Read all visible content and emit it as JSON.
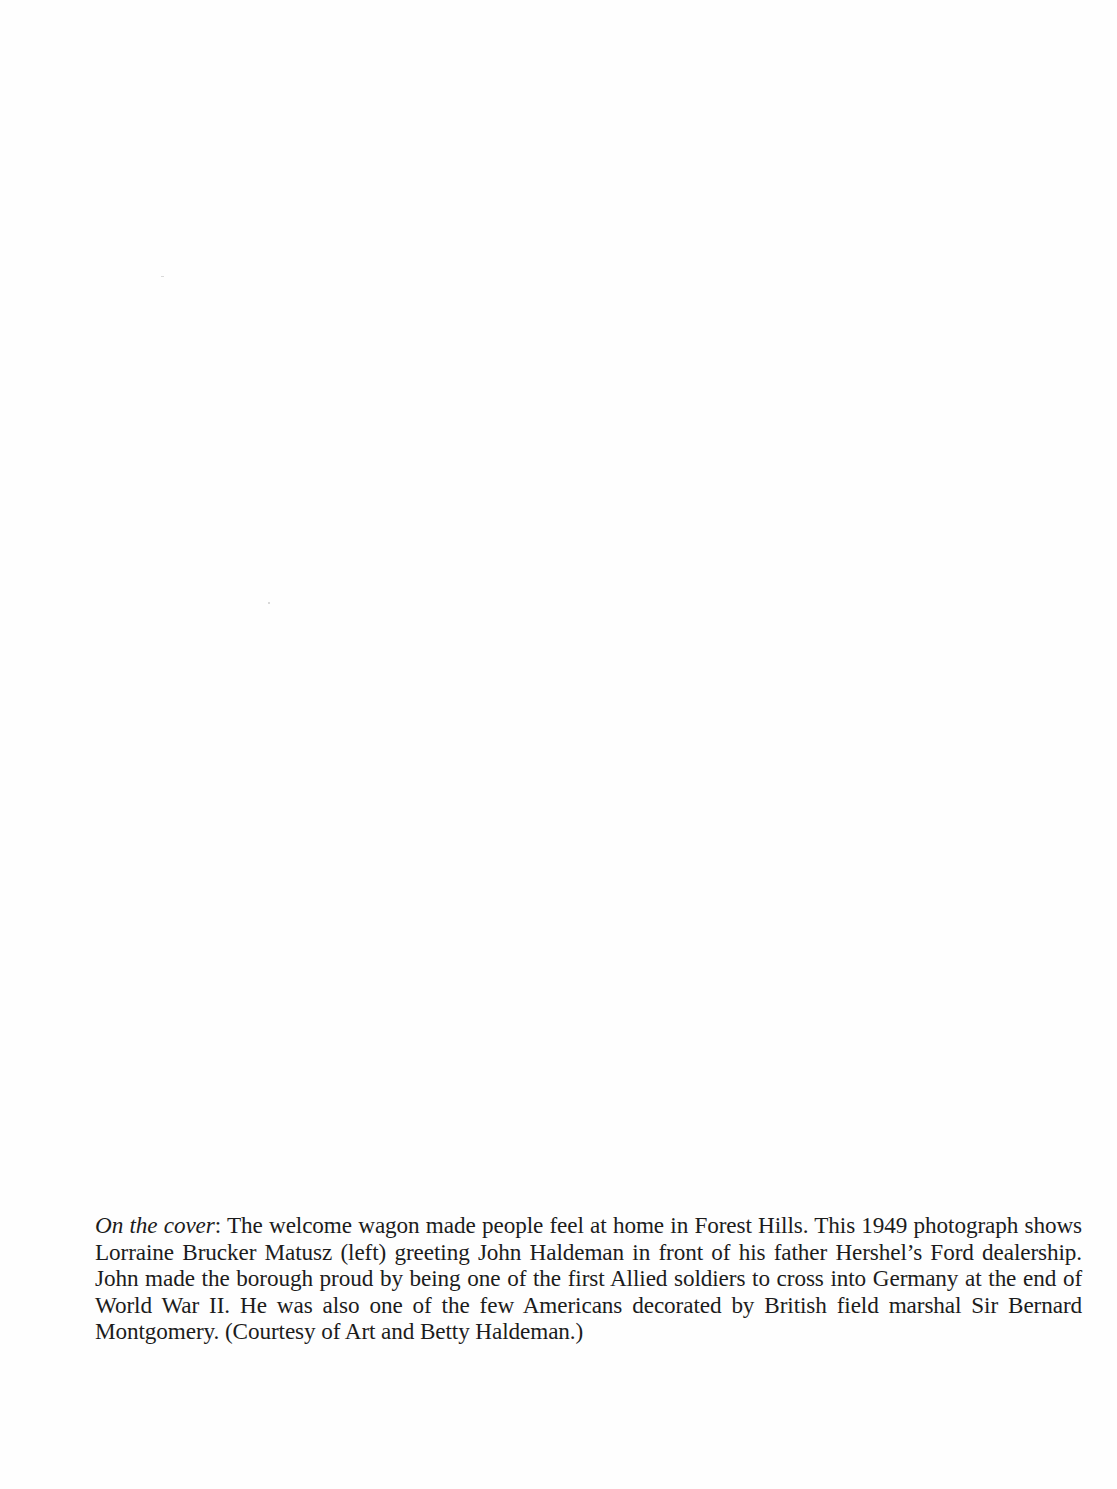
{
  "page": {
    "background": "#fefefe",
    "text_color": "#1c1c1c"
  },
  "caption": {
    "lead": "On the cover",
    "lead_suffix": ": ",
    "body": "The welcome wagon made people feel at home in Forest Hills. This 1949 photograph shows Lorraine Brucker Matusz (left) greeting John Haldeman in front of his father Hershel’s Ford dealership. John made the borough proud by being one of the first Allied soldiers to cross into Germany at the end of World War II. He was also one of the few Americans decorated by British field marshal Sir Bernard Montgomery. (Courtesy of Art and Betty Haldeman.)"
  }
}
